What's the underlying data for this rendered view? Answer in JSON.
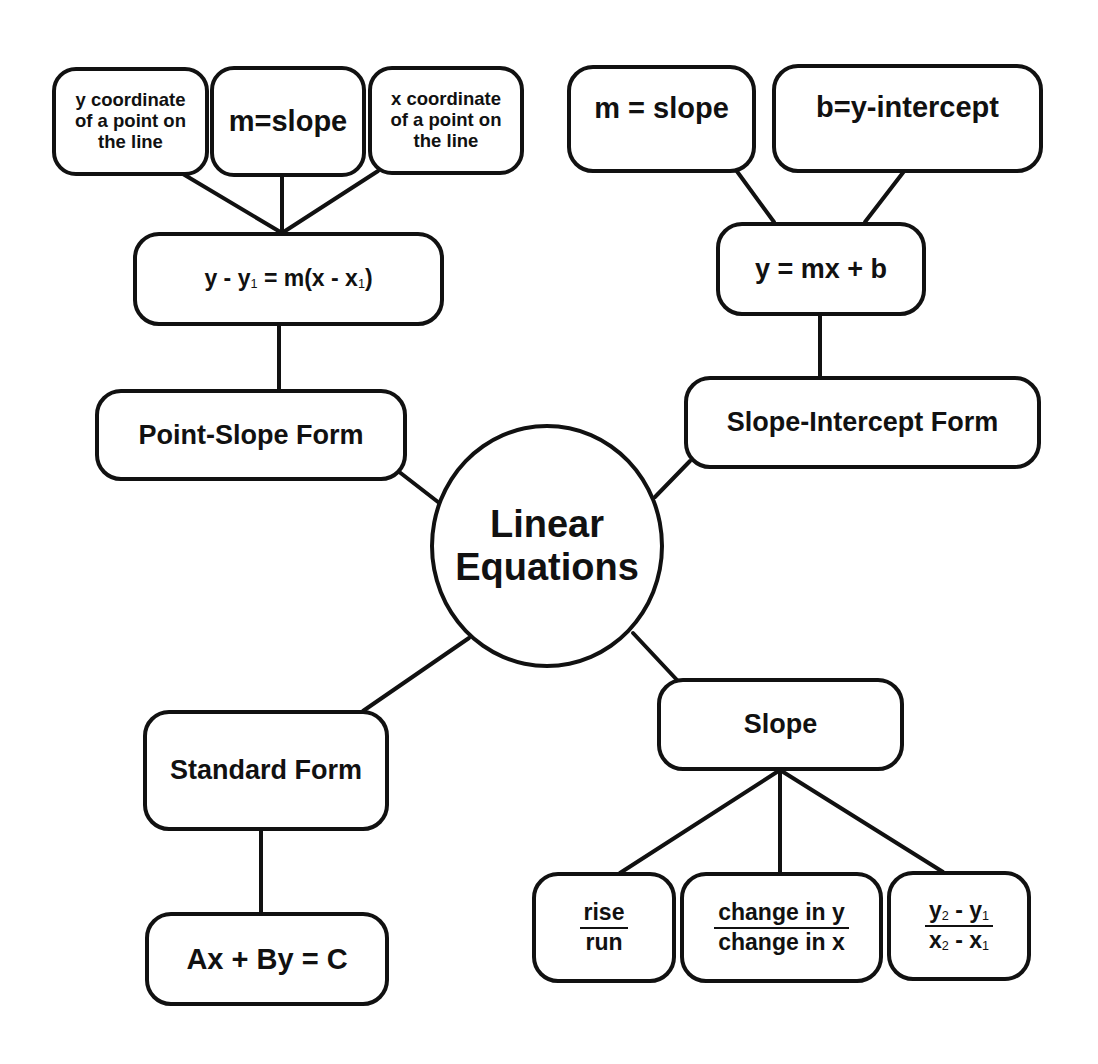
{
  "diagram": {
    "type": "concept-map",
    "center": {
      "label_line1": "Linear",
      "label_line2": "Equations"
    },
    "point_slope": {
      "title": "Point-Slope Form",
      "formula": {
        "y": "y",
        "minus1": " - ",
        "y1": "y",
        "sub1": "1",
        "eq": " = m(",
        "x": "x",
        "minus2": " - ",
        "x1": "x",
        "sub2": "1",
        "close": ")"
      },
      "parts": [
        {
          "line1": "y coordinate",
          "line2": "of a point on",
          "line3": "the line"
        },
        {
          "line1": "m=slope"
        },
        {
          "line1": "x coordinate",
          "line2": "of a point on",
          "line3": "the line"
        }
      ]
    },
    "slope_intercept": {
      "title": "Slope-Intercept Form",
      "formula": "y = mx + b",
      "parts": [
        {
          "label": "m = slope"
        },
        {
          "label": "b=y-intercept"
        }
      ]
    },
    "standard": {
      "title": "Standard Form",
      "formula": "Ax + By = C"
    },
    "slope": {
      "title": "Slope",
      "parts": [
        {
          "num": "rise",
          "den": "run"
        },
        {
          "num": "change in y",
          "den": "change in x"
        },
        {
          "num_a": "y",
          "num_a_sub": "2",
          "num_op": " - ",
          "num_b": "y",
          "num_b_sub": "1",
          "den_a": "x",
          "den_a_sub": "2",
          "den_op": " - ",
          "den_b": "x",
          "den_b_sub": "1"
        }
      ]
    },
    "colors": {
      "stroke": "#111111",
      "fill": "#ffffff",
      "text": "#111111"
    }
  }
}
